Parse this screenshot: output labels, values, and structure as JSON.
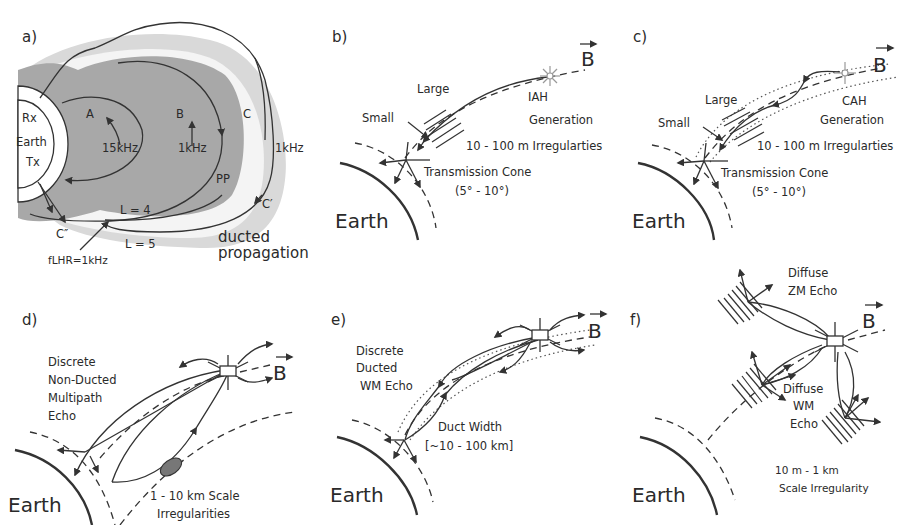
{
  "figure": {
    "panels": {
      "a": {
        "label": "a)",
        "rx": "Rx",
        "earth": "Earth",
        "tx": "Tx",
        "path_a": "A",
        "path_b": "B",
        "path_c": "C",
        "freq_a": "15kHz",
        "freq_b": "1kHz",
        "freq_c": "1kHz",
        "pp": "PP",
        "c_prime": "C′",
        "c_dprime": "C″",
        "l4": "L = 4",
        "l5": "L = 5",
        "flhr": "fLHR=1kHz",
        "ducted_1": "ducted",
        "ducted_2": "propagation",
        "colors": {
          "plasmasphere": "#a8a8a8",
          "outer_band": "#d9d9d9"
        }
      },
      "b": {
        "label": "b)",
        "b_vector": "B",
        "large": "Large",
        "small": "Small",
        "gen_1": "IAH",
        "gen_2": "Generation",
        "irregularities": "10 - 100 m Irregularties",
        "cone_1": "Transmission Cone",
        "cone_2": "(5° - 10°)",
        "earth": "Earth"
      },
      "c": {
        "label": "c)",
        "b_vector": "B",
        "large": "Large",
        "small": "Small",
        "gen_1": "CAH",
        "gen_2": "Generation",
        "irregularities": "10 - 100 m Irregularties",
        "cone_1": "Transmission Cone",
        "cone_2": "(5° - 10°)",
        "earth": "Earth"
      },
      "d": {
        "label": "d)",
        "b_vector": "B",
        "echo_1": "Discrete",
        "echo_2": "Non-Ducted",
        "echo_3": "Multipath",
        "echo_4": "Echo",
        "irr_1": "1 - 10 km Scale",
        "irr_2": "Irregularities",
        "earth": "Earth"
      },
      "e": {
        "label": "e)",
        "b_vector": "B",
        "echo_1": "Discrete",
        "echo_2": "Ducted",
        "echo_3": "WM Echo",
        "duct_1": "Duct Width",
        "duct_2": "[~10 - 100 km]",
        "earth": "Earth"
      },
      "f": {
        "label": "f)",
        "b_vector": "B",
        "zm_1": "Diffuse",
        "zm_2": "ZM Echo",
        "wm_1": "Diffuse",
        "wm_2": "WM",
        "wm_3": "Echo",
        "irr_1": "10 m - 1 km",
        "irr_2": "Scale Irregularity",
        "earth": "Earth"
      }
    }
  }
}
